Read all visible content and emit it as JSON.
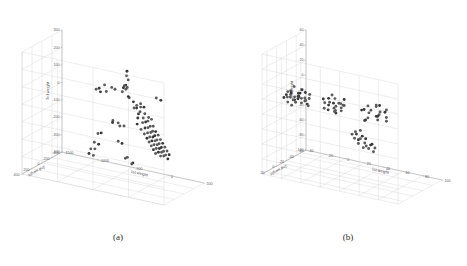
{
  "figure": {
    "background": "#ffffff",
    "point_color": "#5c5c5c",
    "grid_color": "#cfcfcf",
    "axis_color": "#9a9a9a"
  },
  "captions": {
    "a": "(a)",
    "b": "(b)"
  },
  "chart_data": [
    {
      "type": "scatter",
      "panel": "a",
      "title": "",
      "xlabel": "1st weight",
      "ylabel": "2nd weight",
      "zlabel": "3rd weight",
      "xlim": [
        -1500,
        500
      ],
      "ylim": [
        -400,
        400
      ],
      "zlim": [
        -400,
        300
      ],
      "xticks": [
        -1500,
        -1000,
        -500,
        0,
        500
      ],
      "yticks": [
        -400,
        -200,
        0,
        200,
        400
      ],
      "zticks": [
        -400,
        -300,
        -200,
        -100,
        0,
        100,
        200,
        300
      ],
      "xticklabels": [
        "-1500",
        "-1000",
        "-500",
        "0",
        "500"
      ],
      "yticklabels": [
        "-400",
        "-200",
        "0",
        "200",
        "400"
      ],
      "zticklabels": [
        "-400",
        "-300",
        "-200",
        "-100",
        "0",
        "100",
        "200",
        "300"
      ],
      "grid": true,
      "legend": "none",
      "points": [
        [
          -120,
          260,
          290
        ],
        [
          -130,
          255,
          262
        ],
        [
          -110,
          250,
          240
        ],
        [
          -150,
          240,
          205
        ],
        [
          -175,
          235,
          198
        ],
        [
          -140,
          228,
          190
        ],
        [
          -190,
          232,
          185
        ],
        [
          -160,
          225,
          178
        ],
        [
          -60,
          300,
          150
        ],
        [
          20,
          330,
          138
        ],
        [
          60,
          320,
          120
        ],
        [
          100,
          300,
          130
        ],
        [
          30,
          280,
          96
        ],
        [
          80,
          270,
          104
        ],
        [
          -20,
          260,
          88
        ],
        [
          140,
          290,
          112
        ],
        [
          -430,
          60,
          128
        ],
        [
          -340,
          40,
          118
        ],
        [
          -250,
          50,
          100
        ],
        [
          -640,
          -30,
          120
        ],
        [
          -560,
          -60,
          108
        ],
        [
          -780,
          -120,
          74
        ],
        [
          -700,
          -150,
          58
        ],
        [
          -900,
          -230,
          40
        ],
        [
          -860,
          -260,
          24
        ],
        [
          50,
          240,
          70
        ],
        [
          110,
          230,
          62
        ],
        [
          10,
          215,
          50
        ],
        [
          160,
          225,
          44
        ],
        [
          70,
          205,
          30
        ],
        [
          -10,
          200,
          22
        ],
        [
          130,
          195,
          16
        ],
        [
          190,
          210,
          34
        ],
        [
          90,
          185,
          6
        ],
        [
          40,
          175,
          -4
        ],
        [
          150,
          180,
          -14
        ],
        [
          -40,
          170,
          -20
        ],
        [
          200,
          190,
          -8
        ],
        [
          110,
          165,
          -28
        ],
        [
          60,
          155,
          -36
        ],
        [
          170,
          160,
          -44
        ],
        [
          0,
          150,
          -50
        ],
        [
          220,
          170,
          -40
        ],
        [
          130,
          140,
          -58
        ],
        [
          80,
          132,
          -66
        ],
        [
          185,
          138,
          -72
        ],
        [
          30,
          125,
          -78
        ],
        [
          240,
          148,
          -62
        ],
        [
          145,
          118,
          -86
        ],
        [
          95,
          110,
          -92
        ],
        [
          200,
          115,
          -98
        ],
        [
          50,
          102,
          -104
        ],
        [
          255,
          125,
          -90
        ],
        [
          160,
          96,
          -110
        ],
        [
          110,
          88,
          -116
        ],
        [
          215,
          92,
          -122
        ],
        [
          65,
          80,
          -128
        ],
        [
          270,
          100,
          -114
        ],
        [
          175,
          74,
          -134
        ],
        [
          125,
          66,
          -140
        ],
        [
          230,
          70,
          -146
        ],
        [
          80,
          58,
          -152
        ],
        [
          285,
          78,
          -138
        ],
        [
          190,
          52,
          -158
        ],
        [
          140,
          44,
          -164
        ],
        [
          245,
          48,
          -170
        ],
        [
          95,
          36,
          -176
        ],
        [
          300,
          56,
          -162
        ],
        [
          205,
          30,
          -182
        ],
        [
          155,
          22,
          -188
        ],
        [
          260,
          26,
          -194
        ],
        [
          110,
          14,
          -200
        ],
        [
          315,
          34,
          -186
        ],
        [
          220,
          8,
          -206
        ],
        [
          170,
          0,
          -212
        ],
        [
          275,
          4,
          -218
        ],
        [
          -480,
          30,
          -60
        ],
        [
          -420,
          10,
          -72
        ],
        [
          -520,
          -20,
          -84
        ],
        [
          -380,
          -50,
          -96
        ],
        [
          -460,
          -80,
          -108
        ],
        [
          -560,
          150,
          -120
        ],
        [
          -620,
          130,
          -132
        ],
        [
          -700,
          90,
          -196
        ],
        [
          -660,
          60,
          -208
        ],
        [
          -740,
          20,
          -248
        ],
        [
          -820,
          -10,
          -260
        ],
        [
          -880,
          -60,
          -300
        ],
        [
          -840,
          -90,
          -312
        ],
        [
          -300,
          180,
          -140
        ],
        [
          -260,
          160,
          -152
        ],
        [
          -200,
          140,
          -230
        ],
        [
          -240,
          120,
          -242
        ],
        [
          -150,
          100,
          -264
        ],
        [
          -180,
          80,
          -276
        ],
        [
          250,
          200,
          160
        ],
        [
          300,
          180,
          148
        ]
      ]
    },
    {
      "type": "scatter",
      "panel": "b",
      "title": "",
      "xlabel": "1st weight",
      "ylabel": "2nd weight",
      "zlabel": "3rd weight",
      "xlim": [
        -40,
        100
      ],
      "ylim": [
        -60,
        30
      ],
      "zlim": [
        -100,
        60
      ],
      "xticks": [
        -40,
        -20,
        0,
        20,
        40,
        60,
        80,
        100
      ],
      "yticks": [
        -60,
        -40,
        -20,
        0,
        20
      ],
      "zticks": [
        -100,
        -80,
        -60,
        -40,
        -20,
        0,
        20,
        40,
        60
      ],
      "xticklabels": [
        "-40",
        "-20",
        "0",
        "20",
        "40",
        "60",
        "80",
        "100"
      ],
      "yticklabels": [
        "-60",
        "-40",
        "-20",
        "0",
        "20"
      ],
      "zticklabels": [
        "-100",
        "-80",
        "-60",
        "-40",
        "-20",
        "0",
        "20",
        "40",
        "60"
      ],
      "grid": true,
      "legend": "none",
      "clusters": [
        {
          "name": "cluster-left",
          "center": [
            -15,
            8,
            0
          ],
          "count": 32
        },
        {
          "name": "cluster-middle",
          "center": [
            25,
            5,
            2
          ],
          "count": 24
        },
        {
          "name": "cluster-right",
          "center": [
            65,
            2,
            4
          ],
          "count": 20
        },
        {
          "name": "cluster-lower",
          "center": [
            30,
            -42,
            -62
          ],
          "count": 18
        }
      ],
      "points": [
        [
          -24,
          12,
          4
        ],
        [
          -21,
          10,
          1
        ],
        [
          -19,
          13,
          6
        ],
        [
          -17,
          9,
          -2
        ],
        [
          -22,
          7,
          8
        ],
        [
          -16,
          11,
          3
        ],
        [
          -14,
          8,
          0
        ],
        [
          -20,
          6,
          -4
        ],
        [
          -12,
          12,
          5
        ],
        [
          -18,
          14,
          9
        ],
        [
          -10,
          9,
          2
        ],
        [
          -25,
          8,
          -1
        ],
        [
          -13,
          6,
          7
        ],
        [
          -9,
          11,
          -3
        ],
        [
          -15,
          4,
          1
        ],
        [
          -11,
          13,
          6
        ],
        [
          -7,
          8,
          3
        ],
        [
          -23,
          11,
          -6
        ],
        [
          -8,
          5,
          9
        ],
        [
          -6,
          10,
          0
        ],
        [
          -26,
          5,
          5
        ],
        [
          -5,
          7,
          -5
        ],
        [
          -4,
          12,
          2
        ],
        [
          -3,
          6,
          8
        ],
        [
          -28,
          9,
          -2
        ],
        [
          -2,
          9,
          4
        ],
        [
          -19,
          3,
          -8
        ],
        [
          -13,
          2,
          10
        ],
        [
          -17,
          15,
          -7
        ],
        [
          -6,
          3,
          -9
        ],
        [
          -10,
          15,
          11
        ],
        [
          -21,
          2,
          12
        ],
        [
          14,
          9,
          3
        ],
        [
          17,
          7,
          0
        ],
        [
          20,
          11,
          6
        ],
        [
          23,
          8,
          -2
        ],
        [
          16,
          5,
          8
        ],
        [
          26,
          10,
          2
        ],
        [
          29,
          6,
          5
        ],
        [
          19,
          12,
          -4
        ],
        [
          22,
          4,
          9
        ],
        [
          31,
          9,
          1
        ],
        [
          25,
          13,
          7
        ],
        [
          28,
          3,
          -6
        ],
        [
          33,
          7,
          4
        ],
        [
          15,
          14,
          10
        ],
        [
          21,
          1,
          -8
        ],
        [
          30,
          12,
          8
        ],
        [
          24,
          6,
          -9
        ],
        [
          18,
          2,
          12
        ],
        [
          27,
          15,
          -3
        ],
        [
          32,
          5,
          11
        ],
        [
          13,
          8,
          -5
        ],
        [
          34,
          11,
          6
        ],
        [
          54,
          8,
          5
        ],
        [
          58,
          6,
          1
        ],
        [
          62,
          10,
          7
        ],
        [
          66,
          7,
          -1
        ],
        [
          56,
          4,
          9
        ],
        [
          70,
          9,
          3
        ],
        [
          74,
          5,
          6
        ],
        [
          60,
          12,
          -3
        ],
        [
          64,
          3,
          10
        ],
        [
          68,
          8,
          0
        ],
        [
          72,
          11,
          8
        ],
        [
          76,
          6,
          -5
        ],
        [
          52,
          9,
          4
        ],
        [
          78,
          10,
          2
        ],
        [
          57,
          13,
          -7
        ],
        [
          67,
          2,
          12
        ],
        [
          71,
          14,
          -2
        ],
        [
          63,
          1,
          11
        ],
        [
          55,
          7,
          -9
        ],
        [
          75,
          4,
          9
        ],
        [
          22,
          -38,
          -50
        ],
        [
          24,
          -36,
          -52
        ],
        [
          26,
          -40,
          -48
        ],
        [
          18,
          -44,
          -62
        ],
        [
          21,
          -46,
          -64
        ],
        [
          25,
          -42,
          -60
        ],
        [
          28,
          -45,
          -66
        ],
        [
          31,
          -41,
          -58
        ],
        [
          20,
          -48,
          -70
        ],
        [
          27,
          -50,
          -72
        ],
        [
          33,
          -47,
          -68
        ],
        [
          23,
          -52,
          -76
        ],
        [
          30,
          -49,
          -74
        ],
        [
          36,
          -44,
          -65
        ],
        [
          17,
          -41,
          -56
        ],
        [
          34,
          -51,
          -78
        ],
        [
          29,
          -38,
          -54
        ],
        [
          38,
          -46,
          -70
        ]
      ]
    }
  ]
}
